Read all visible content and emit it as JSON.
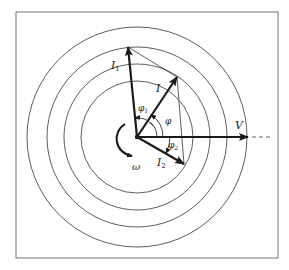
{
  "diagram": {
    "frame": {
      "x": 16,
      "y": 12,
      "width": 262,
      "height": 246,
      "color": "#555555"
    },
    "center": {
      "x": 137,
      "y": 137
    },
    "circles": [
      {
        "r": 110
      },
      {
        "r": 90
      },
      {
        "r": 73
      },
      {
        "r": 56
      }
    ],
    "phasors": [
      {
        "id": "V",
        "label": "V",
        "tip": {
          "x": 248,
          "y": 137
        }
      },
      {
        "id": "I1",
        "label": "I",
        "sub": "1",
        "tip": {
          "x": 128,
          "y": 47
        }
      },
      {
        "id": "I",
        "label": "I",
        "sub": "",
        "tip": {
          "x": 177,
          "y": 77
        }
      },
      {
        "id": "I2",
        "label": "I",
        "sub": "2",
        "tip": {
          "x": 184,
          "y": 164
        }
      }
    ],
    "angles": [
      {
        "id": "phi1",
        "label": "φ",
        "sub": "1"
      },
      {
        "id": "phi",
        "label": "φ",
        "sub": ""
      },
      {
        "id": "phi2",
        "label": "φ",
        "sub": "2"
      }
    ],
    "rotation": {
      "label": "ω"
    },
    "colors": {
      "ink": "#1a1a1a",
      "thin": "#333333"
    }
  }
}
